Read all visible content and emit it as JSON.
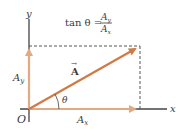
{
  "diagram": {
    "formula": {
      "lhs": "tan θ =",
      "numerator": "A",
      "numerator_sub": "y",
      "denominator": "A",
      "denominator_sub": "x"
    },
    "axes": {
      "x_label": "x",
      "y_label": "y",
      "origin_label": "O"
    },
    "vector": {
      "label": "A",
      "arrow_mark": "→"
    },
    "components": {
      "x_label": "A",
      "x_sub": "x",
      "y_label": "A",
      "y_sub": "y"
    },
    "angle_label": "θ",
    "colors": {
      "vector": "#d07a45",
      "component": "#e2a982",
      "axis": "#444444",
      "dashed": "#555555",
      "text": "#3a3a3a"
    }
  }
}
